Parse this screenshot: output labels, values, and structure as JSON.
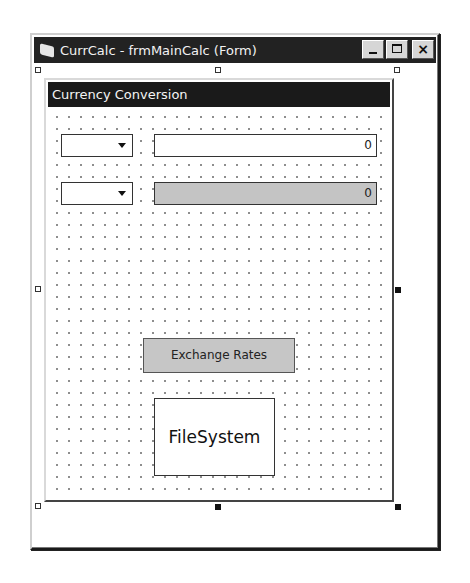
{
  "window": {
    "title": "CurrCalc - frmMainCalc (Form)",
    "icon": "form-icon",
    "buttons": {
      "minimize": "minimize-icon",
      "maximize": "maximize-icon",
      "close": "×"
    }
  },
  "form": {
    "caption": "Currency Conversion",
    "rows": [
      {
        "combo_value": "",
        "amount": "0",
        "amount_readonly": false
      },
      {
        "combo_value": "",
        "amount": "0",
        "amount_readonly": true
      }
    ],
    "exchange_rates_label": "Exchange Rates",
    "filesystem_label": "FileSystem"
  },
  "colors": {
    "titlebar": "#222222",
    "caption_bar": "#1a1a1a",
    "readonly_field": "#c4c4c4",
    "button_face": "#c6c6c6"
  }
}
